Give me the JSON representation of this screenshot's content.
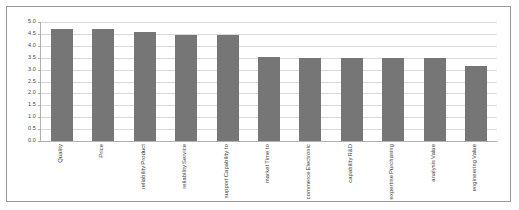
{
  "chart_data": {
    "type": "bar",
    "title": "",
    "subtitle": "",
    "xlabel": "",
    "ylabel": "",
    "ylim": [
      0.0,
      5.0
    ],
    "ytick_step": 0.5,
    "grid": true,
    "legend": false,
    "legend_position": "none",
    "bar_color": "#767676",
    "gridline_color": "#d9d9d9",
    "axis_color": "#b0b0b0",
    "frame_color": "#9a9a9a",
    "background": "#ffffff",
    "xlabel_rotation_deg": 90,
    "ytick_labels": [
      "5.0",
      "4.5",
      "4.0",
      "3.5",
      "3.0",
      "2.5",
      "2.0",
      "1.5",
      "1.0",
      "0.5",
      "0.0"
    ],
    "ytick_values": [
      5.0,
      4.5,
      4.0,
      3.5,
      3.0,
      2.5,
      2.0,
      1.5,
      1.0,
      0.5,
      0.0
    ],
    "categories": [
      "Quality",
      "Price",
      "Product reliability",
      "Service reliability",
      "Capability to support",
      "Time to market",
      "Electronic commerce",
      "R&D capability",
      "Purchasing expertise",
      "Value analysis",
      "Value engineering"
    ],
    "category_lines": [
      [
        "Quality"
      ],
      [
        "Price"
      ],
      [
        "Product",
        "reliability"
      ],
      [
        "Service",
        "reliability"
      ],
      [
        "Capability to",
        "support"
      ],
      [
        "Time to",
        "market"
      ],
      [
        "Electronic",
        "commerce"
      ],
      [
        "R&D",
        "capability"
      ],
      [
        "Purchasing",
        "expertise"
      ],
      [
        "Value",
        "analysis"
      ],
      [
        "Value",
        "engineering"
      ]
    ],
    "values": [
      4.7,
      4.7,
      4.6,
      4.45,
      4.45,
      3.55,
      3.5,
      3.5,
      3.5,
      3.48,
      3.15
    ]
  }
}
